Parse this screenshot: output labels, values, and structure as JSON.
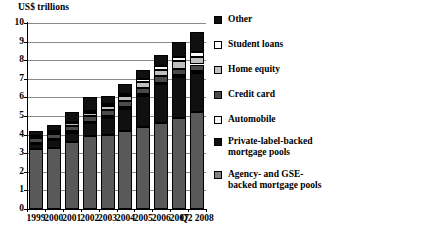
{
  "chart_data": {
    "type": "bar",
    "subtype": "stacked-vertical",
    "title": "",
    "ylabel": "US$ trillions",
    "xlabel": "",
    "ylim": [
      0,
      10
    ],
    "ytick_values": [
      "10",
      "9",
      "8",
      "7",
      "6",
      "5",
      "4",
      "3",
      "2",
      "1",
      "0"
    ],
    "grid": true,
    "grid_axis": "y",
    "legend_position": "right",
    "categories": [
      "1999",
      "2000",
      "2001",
      "2002",
      "2003",
      "2004",
      "2005",
      "2006",
      "2007",
      "Q2\n2008"
    ],
    "series": [
      {
        "name": "Agency- and GSE-backed mortgage pools",
        "color": "#595959",
        "values": [
          3.2,
          3.3,
          3.6,
          3.9,
          4.0,
          4.2,
          4.4,
          4.6,
          4.9,
          5.2
        ]
      },
      {
        "name": "Private-label-backed mortgage pools",
        "color": "#101010",
        "values": [
          0.3,
          0.4,
          0.5,
          0.7,
          0.9,
          1.2,
          1.7,
          2.1,
          2.2,
          2.1
        ]
      },
      {
        "name": "Automobile",
        "color": "#f2f2f2",
        "values": [
          0.06,
          0.07,
          0.08,
          0.09,
          0.1,
          0.1,
          0.1,
          0.1,
          0.1,
          0.1
        ]
      },
      {
        "name": "Credit card",
        "color": "#4a4a4a",
        "values": [
          0.24,
          0.27,
          0.3,
          0.32,
          0.34,
          0.33,
          0.32,
          0.33,
          0.35,
          0.37
        ]
      },
      {
        "name": "Home equity",
        "color": "#bfbfbf",
        "values": [
          0.08,
          0.1,
          0.13,
          0.17,
          0.2,
          0.24,
          0.3,
          0.37,
          0.4,
          0.4
        ]
      },
      {
        "name": "Student loans",
        "color": "#fbfbfb",
        "values": [
          0.06,
          0.07,
          0.08,
          0.1,
          0.12,
          0.14,
          0.16,
          0.2,
          0.24,
          0.26
        ]
      },
      {
        "name": "Other",
        "color": "#101010",
        "values": [
          0.26,
          0.29,
          0.51,
          0.72,
          0.44,
          0.49,
          0.52,
          0.6,
          0.81,
          1.07
        ]
      }
    ],
    "totals": [
      4.2,
      4.5,
      5.2,
      6.0,
      6.1,
      6.7,
      7.5,
      8.3,
      9.0,
      9.5
    ],
    "legend_entries": [
      {
        "label": "Other",
        "color": "#101010"
      },
      {
        "label": "Student loans",
        "color": "#ffffff"
      },
      {
        "label": "Home equity",
        "color": "#bfbfbf"
      },
      {
        "label": "Credit card",
        "color": "#4a4a4a"
      },
      {
        "label": "Automobile",
        "color": "#f7f7f7"
      },
      {
        "label": "Private-label-backed\nmortgage pools",
        "color": "#101010"
      },
      {
        "label": "Agency- and GSE-\nbacked mortgage pools",
        "color": "#808080"
      }
    ]
  }
}
